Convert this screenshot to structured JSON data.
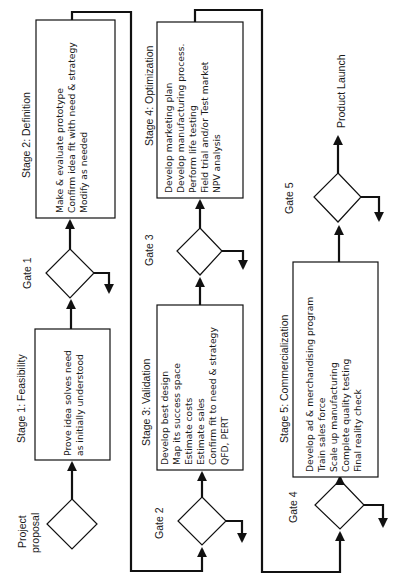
{
  "title_fragment": "",
  "diagram": {
    "orientation": "rotated-90-ccw",
    "start": {
      "label_line1": "Project",
      "label_line2": "proposal"
    },
    "gates": [
      {
        "id": "gate1",
        "label": "Gate 1"
      },
      {
        "id": "gate2",
        "label": "Gate 2"
      },
      {
        "id": "gate3",
        "label": "Gate 3"
      },
      {
        "id": "gate4",
        "label": "Gate 4"
      },
      {
        "id": "gate5",
        "label": "Gate 5"
      }
    ],
    "stages": [
      {
        "id": "stage1",
        "title": "Stage 1: Feasibility",
        "lines": [
          "Prove idea solves need",
          "as initially understood"
        ]
      },
      {
        "id": "stage2",
        "title": "Stage 2: Definition",
        "lines": [
          "Make & evaluate prototype",
          "Confirm idea fit with need & strategy",
          "Modify as needed"
        ]
      },
      {
        "id": "stage3",
        "title": "Stage 3: Validation",
        "lines": [
          "Develop best design",
          "Map its success space",
          "Estimate costs",
          "Estimate sales",
          "Confirm fit to need & strategy",
          "QFD, PERT"
        ]
      },
      {
        "id": "stage4",
        "title": "Stage 4: Optimization",
        "lines": [
          "Develop marketing plan",
          "Develop manufacturing process.",
          "Perform life testing",
          "Field trial and/or Test market",
          "NPV analysis"
        ]
      },
      {
        "id": "stage5",
        "title": "Stage 5: Commercialization",
        "lines": [
          "Develop ad & merchandising program",
          "Train sales force",
          "Scale up manufacturing",
          "Complete quality testing",
          "Final reality check"
        ]
      }
    ],
    "end": {
      "label": "Product Launch"
    },
    "colors": {
      "line": "#111111",
      "background": "#ffffff",
      "text": "#1a1a1a"
    }
  }
}
